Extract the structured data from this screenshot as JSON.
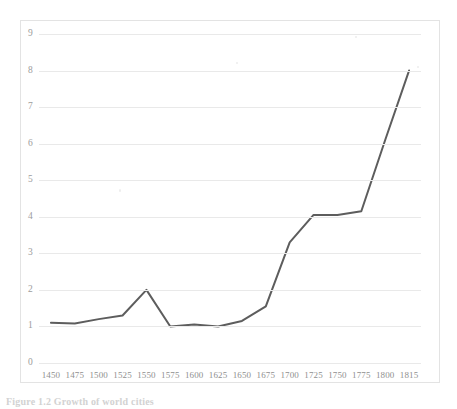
{
  "figure": {
    "caption": "Figure 1.2  Growth of world cities"
  },
  "chart_data": {
    "type": "line",
    "title": "",
    "xlabel": "",
    "ylabel": "",
    "categories": [
      "1450",
      "1475",
      "1500",
      "1525",
      "1550",
      "1575",
      "1600",
      "1625",
      "1650",
      "1675",
      "1700",
      "1725",
      "1750",
      "1775",
      "1800",
      "1815"
    ],
    "values": [
      1.1,
      1.08,
      1.2,
      1.3,
      2.0,
      1.0,
      1.05,
      1.0,
      1.15,
      1.55,
      3.3,
      4.05,
      4.05,
      4.15,
      6.1,
      8.0
    ],
    "series": [
      {
        "name": "series-1",
        "values": [
          1.1,
          1.08,
          1.2,
          1.3,
          2.0,
          1.0,
          1.05,
          1.0,
          1.15,
          1.55,
          3.3,
          4.05,
          4.05,
          4.15,
          6.1,
          8.0
        ]
      }
    ],
    "yticks": [
      "0",
      "1",
      "2",
      "3",
      "4",
      "5",
      "6",
      "7",
      "8",
      "9"
    ],
    "ylim": [
      0,
      9
    ],
    "grid": "horizontal",
    "legend": "none",
    "line_color": "#5d5d5d",
    "grid_color": "#e9e9e9",
    "plot_background": "#ffffff",
    "border_color": "#e3e3e3"
  }
}
